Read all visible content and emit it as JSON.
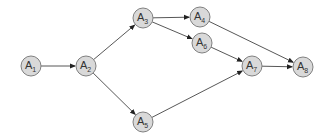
{
  "diagram": {
    "type": "directed-graph",
    "node_radius": 10,
    "colors": {
      "node_fill": "#d9d9d9",
      "node_stroke": "#808080",
      "edge": "#444444",
      "text": "#333333"
    },
    "nodes": [
      {
        "id": "A1",
        "base": "A",
        "sub": "1",
        "x": 31,
        "y": 66
      },
      {
        "id": "A2",
        "base": "A",
        "sub": "2",
        "x": 86,
        "y": 66
      },
      {
        "id": "A3",
        "base": "A",
        "sub": "3",
        "x": 143,
        "y": 18
      },
      {
        "id": "A4",
        "base": "A",
        "sub": "4",
        "x": 200,
        "y": 17
      },
      {
        "id": "A5",
        "base": "A",
        "sub": "5",
        "x": 143,
        "y": 122
      },
      {
        "id": "A6",
        "base": "A",
        "sub": "6",
        "x": 202,
        "y": 43
      },
      {
        "id": "A7",
        "base": "A",
        "sub": "7",
        "x": 252,
        "y": 66
      },
      {
        "id": "A8",
        "base": "A",
        "sub": "8",
        "x": 303,
        "y": 67
      }
    ],
    "edges": [
      {
        "from": "A1",
        "to": "A2"
      },
      {
        "from": "A2",
        "to": "A3"
      },
      {
        "from": "A2",
        "to": "A5"
      },
      {
        "from": "A3",
        "to": "A4"
      },
      {
        "from": "A3",
        "to": "A6"
      },
      {
        "from": "A4",
        "to": "A8"
      },
      {
        "from": "A6",
        "to": "A7"
      },
      {
        "from": "A5",
        "to": "A7"
      },
      {
        "from": "A7",
        "to": "A8"
      }
    ]
  }
}
